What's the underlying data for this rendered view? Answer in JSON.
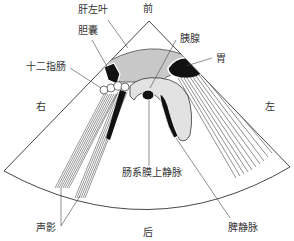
{
  "diagram": {
    "type": "ultrasound transverse section schematic",
    "orientation": {
      "top": "前",
      "bottom": "后",
      "left": "右",
      "right": "左"
    },
    "labels": {
      "liver_left_lobe": "肝左叶",
      "gallbladder": "胆囊",
      "duodenum": "十二指肠",
      "pancreas": "胰腺",
      "stomach": "胃",
      "superior_mesenteric_vein": "肠系膜上静脉",
      "splenic_vein": "脾静脉",
      "acoustic_shadow": "声影"
    },
    "colors": {
      "liver": "#c8c8c8",
      "pancreas": "#e2e2e2",
      "dark_structure": "#111111",
      "outline": "#333333",
      "background": "#ffffff"
    }
  }
}
